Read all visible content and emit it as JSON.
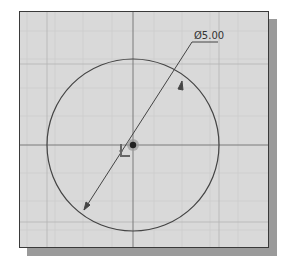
{
  "sketch": {
    "dimension_label": "Ø5.00",
    "colors": {
      "background": "#d9d9d9",
      "grid_minor": "#c8c8c8",
      "grid_major": "#b0b0b0",
      "axis": "#808080",
      "geometry": "#444444",
      "shadow": "#9a9a9a",
      "border": "#3a3a3a"
    },
    "circle": {
      "cx": 113,
      "cy": 133,
      "r": 86
    },
    "icons": [
      "origin-point-icon",
      "coordinate-axis-icon"
    ]
  }
}
